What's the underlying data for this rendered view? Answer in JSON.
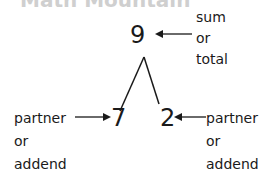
{
  "title": "Math Mountain",
  "sum": {
    "value": "9",
    "label_lines": [
      "sum",
      "or",
      "total"
    ]
  },
  "left_partner": {
    "value": "7",
    "label_lines": [
      "partner",
      "or",
      "addend"
    ]
  },
  "right_partner": {
    "value": "2",
    "label_lines": [
      "partner",
      "or",
      "addend"
    ]
  }
}
